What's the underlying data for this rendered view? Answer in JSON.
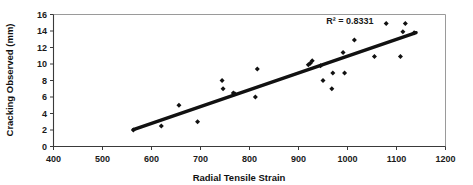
{
  "chart_data": {
    "type": "scatter",
    "title": "",
    "xlabel": "Radial Tensile Strain",
    "ylabel": "Cracking Observed (mm)",
    "xlim": [
      400,
      1200
    ],
    "ylim": [
      0,
      16
    ],
    "xticks": [
      400,
      500,
      600,
      700,
      800,
      900,
      1000,
      1100,
      1200
    ],
    "yticks": [
      0,
      2,
      4,
      6,
      8,
      10,
      12,
      14,
      16
    ],
    "xtick_labels": [
      "400",
      "500",
      "600",
      "700",
      "800",
      "900",
      "1000",
      "1100",
      "1200"
    ],
    "ytick_labels": [
      "0",
      "2",
      "4",
      "6",
      "8",
      "10",
      "12",
      "14",
      "16"
    ],
    "grid": false,
    "legend": false,
    "marker": "diamond",
    "marker_color": "#111111",
    "annotations": [
      {
        "text": "R² = 0.8331",
        "x": 1005,
        "y": 14.8
      }
    ],
    "points": [
      {
        "x": 563,
        "y": 2.0
      },
      {
        "x": 620,
        "y": 2.5
      },
      {
        "x": 656,
        "y": 5.0
      },
      {
        "x": 694,
        "y": 3.0
      },
      {
        "x": 744,
        "y": 8.0
      },
      {
        "x": 746,
        "y": 7.0
      },
      {
        "x": 767,
        "y": 6.5
      },
      {
        "x": 770,
        "y": 6.4
      },
      {
        "x": 812,
        "y": 6.0
      },
      {
        "x": 816,
        "y": 9.4
      },
      {
        "x": 920,
        "y": 9.9
      },
      {
        "x": 924,
        "y": 10.1
      },
      {
        "x": 928,
        "y": 10.4
      },
      {
        "x": 945,
        "y": 9.8
      },
      {
        "x": 950,
        "y": 8.0
      },
      {
        "x": 968,
        "y": 7.0
      },
      {
        "x": 970,
        "y": 8.9
      },
      {
        "x": 991,
        "y": 11.4
      },
      {
        "x": 994,
        "y": 8.9
      },
      {
        "x": 1014,
        "y": 12.9
      },
      {
        "x": 1055,
        "y": 10.9
      },
      {
        "x": 1079,
        "y": 14.9
      },
      {
        "x": 1108,
        "y": 10.9
      },
      {
        "x": 1113,
        "y": 13.9
      },
      {
        "x": 1118,
        "y": 14.9
      },
      {
        "x": 1136,
        "y": 13.8
      }
    ],
    "trend_line": {
      "x_start": 563,
      "y_start": 2.05,
      "x_end": 1140,
      "y_end": 13.8
    }
  }
}
